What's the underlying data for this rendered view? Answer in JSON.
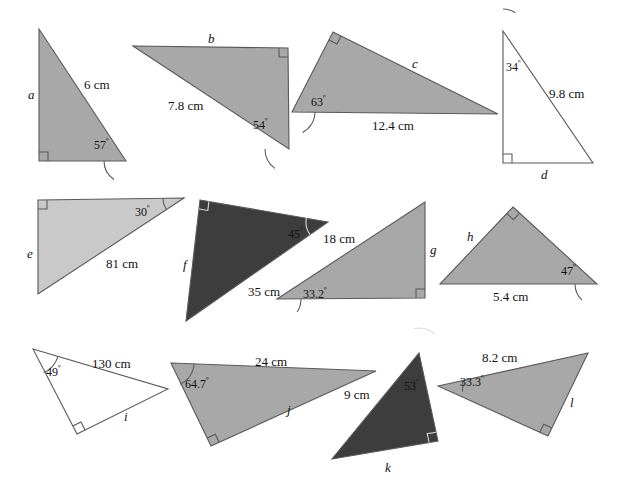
{
  "page": {
    "background_color": "#ffffff",
    "width": 618,
    "height": 491
  },
  "palette": {
    "fill_medium_gray": "#a8a8a8",
    "fill_light_gray": "#c9c9c9",
    "fill_dark_gray": "#3d3d3d",
    "fill_white": "#ffffff",
    "stroke": "#5a5a5a",
    "text": "#111111"
  },
  "figures": [
    {
      "id": "a",
      "name_label": "a",
      "fill": "#a8a8a8",
      "points": "39,29 39,161 126,161",
      "right_angle_at": "39,161",
      "right_angle_dirs": "x+,y-",
      "labels": [
        {
          "kind": "name",
          "text": "a",
          "x": 28,
          "y": 88
        },
        {
          "kind": "side",
          "text": "6 cm",
          "x": 84,
          "y": 78
        },
        {
          "kind": "angle",
          "text": "57",
          "x": 94,
          "y": 139
        }
      ],
      "arc": {
        "cx": 126,
        "cy": 161,
        "r": 22,
        "a0": 180,
        "a1": 237
      }
    },
    {
      "id": "b",
      "name_label": "b",
      "fill": "#a8a8a8",
      "points": "133,46 288,48 289,149",
      "right_angle_at": "288,48",
      "right_angle_dirs": "x-,y+",
      "labels": [
        {
          "kind": "name",
          "text": "b",
          "x": 208,
          "y": 32
        },
        {
          "kind": "side",
          "text": "7.8 cm",
          "x": 168,
          "y": 99
        },
        {
          "kind": "angle",
          "text": "54",
          "x": 253,
          "y": 119
        }
      ],
      "arc": {
        "cx": 289,
        "cy": 149,
        "r": 24,
        "a0": 180,
        "a1": 234
      }
    },
    {
      "id": "c",
      "name_label": "c",
      "fill": "#a8a8a8",
      "points": "333,32 498,114 292,112",
      "right_angle_at": "333,32",
      "right_angle_dirs": "se",
      "labels": [
        {
          "kind": "name",
          "text": "c",
          "x": 412,
          "y": 57
        },
        {
          "kind": "side",
          "text": "12.4 cm",
          "x": 372,
          "y": 119
        },
        {
          "kind": "angle",
          "text": "63",
          "x": 311,
          "y": 96
        }
      ],
      "arc": {
        "cx": 292,
        "cy": 112,
        "r": 23,
        "a0": 0,
        "a1": -63
      }
    },
    {
      "id": "d",
      "name_label": "d",
      "fill": "#ffffff",
      "points": "503,31 593,163 503,163",
      "right_angle_at": "503,163",
      "right_angle_dirs": "x+,y-",
      "labels": [
        {
          "kind": "name",
          "text": "d",
          "x": 541,
          "y": 168
        },
        {
          "kind": "side",
          "text": "9.8 cm",
          "x": 549,
          "y": 87
        },
        {
          "kind": "angle",
          "text": "34",
          "x": 506,
          "y": 61
        }
      ],
      "arc": {
        "cx": 503,
        "cy": 31,
        "r": 22,
        "a0": 90,
        "a1": 56
      }
    },
    {
      "id": "e",
      "name_label": "e",
      "fill": "#c9c9c9",
      "points": "38,200 184,198 38,294",
      "right_angle_at": "38,200",
      "right_angle_dirs": "x+,y+",
      "labels": [
        {
          "kind": "name",
          "text": "e",
          "x": 27,
          "y": 247
        },
        {
          "kind": "side",
          "text": "81 cm",
          "x": 106,
          "y": 257
        },
        {
          "kind": "angle",
          "text": "30",
          "x": 135,
          "y": 206
        }
      ],
      "arc": {
        "cx": 184,
        "cy": 198,
        "r": 21,
        "a0": 180,
        "a1": 213
      }
    },
    {
      "id": "f",
      "name_label": "f",
      "fill": "#3d3d3d",
      "points": "200,200 328,222 186,321",
      "right_angle_at": "200,200",
      "right_angle_dirs": "se",
      "labels": [
        {
          "kind": "name",
          "text": "f",
          "x": 183,
          "y": 258
        },
        {
          "kind": "side",
          "text": "35 cm",
          "x": 248,
          "y": 285
        },
        {
          "kind": "angle",
          "text": "45",
          "x": 288,
          "y": 228
        }
      ],
      "arc": {
        "cx": 328,
        "cy": 222,
        "r": 22,
        "a0": 170,
        "a1": 215
      }
    },
    {
      "id": "g",
      "name_label": "g",
      "fill": "#a8a8a8",
      "points": "425,202 425,298 277,299",
      "right_angle_at": "425,298",
      "right_angle_dirs": "x-,y-",
      "labels": [
        {
          "kind": "name",
          "text": "g",
          "x": 430,
          "y": 243
        },
        {
          "kind": "side",
          "text": "18 cm",
          "x": 323,
          "y": 232
        },
        {
          "kind": "angle",
          "text": "33.2",
          "x": 303,
          "y": 288
        }
      ],
      "arc": {
        "cx": 277,
        "cy": 299,
        "r": 24,
        "a0": 0,
        "a1": -33
      }
    },
    {
      "id": "h",
      "name_label": "h",
      "fill": "#a8a8a8",
      "points": "513,207 597,284 440,284",
      "right_angle_at": "513,207",
      "right_angle_dirs": "diamond",
      "labels": [
        {
          "kind": "name",
          "text": "h",
          "x": 467,
          "y": 230
        },
        {
          "kind": "side",
          "text": "5.4 cm",
          "x": 493,
          "y": 290
        },
        {
          "kind": "angle",
          "text": "47",
          "x": 561,
          "y": 265
        }
      ],
      "arc": {
        "cx": 597,
        "cy": 284,
        "r": 22,
        "a0": 180,
        "a1": 227
      }
    },
    {
      "id": "i",
      "name_label": "i",
      "fill": "#ffffff",
      "points": "33,349 168,389 77,434",
      "right_angle_at": "77,434",
      "right_angle_dirs": "ne",
      "labels": [
        {
          "kind": "name",
          "text": "i",
          "x": 124,
          "y": 410
        },
        {
          "kind": "side",
          "text": "130 cm",
          "x": 92,
          "y": 357
        },
        {
          "kind": "angle",
          "text": "49",
          "x": 46,
          "y": 366
        }
      ],
      "arc": {
        "cx": 33,
        "cy": 349,
        "r": 26,
        "a0": -17,
        "a1": -66
      }
    },
    {
      "id": "j",
      "name_label": "j",
      "fill": "#a8a8a8",
      "points": "171,363 376,371 211,446",
      "right_angle_at": "211,446",
      "right_angle_dirs": "ne",
      "labels": [
        {
          "kind": "name",
          "text": "j",
          "x": 287,
          "y": 403
        },
        {
          "kind": "side",
          "text": "24 cm",
          "x": 255,
          "y": 355
        },
        {
          "kind": "angle",
          "text": "64.7",
          "x": 185,
          "y": 378
        }
      ],
      "arc": {
        "cx": 171,
        "cy": 363,
        "r": 23,
        "a0": -2,
        "a1": -67
      }
    },
    {
      "id": "k",
      "name_label": "k",
      "fill": "#3d3d3d",
      "points": "419,353 438,441 332,459",
      "right_angle_at": "438,441",
      "right_angle_dirs": "nw",
      "labels": [
        {
          "kind": "name",
          "text": "k",
          "x": 385,
          "y": 461
        },
        {
          "kind": "side",
          "text": "9 cm",
          "x": 344,
          "y": 388
        },
        {
          "kind": "angle",
          "text": "53",
          "x": 404,
          "y": 380
        }
      ],
      "arc": {
        "cx": 419,
        "cy": 353,
        "r": 25,
        "a0": 102,
        "a1": 50
      }
    },
    {
      "id": "l",
      "name_label": "l",
      "fill": "#a8a8a8",
      "points": "438,386 588,353 548,436",
      "right_angle_at": "548,436",
      "right_angle_dirs": "nw",
      "labels": [
        {
          "kind": "name",
          "text": "l",
          "x": 570,
          "y": 396
        },
        {
          "kind": "side",
          "text": "8.2 cm",
          "x": 482,
          "y": 351
        },
        {
          "kind": "angle",
          "text": "33.3",
          "x": 460,
          "y": 376
        }
      ],
      "arc": {
        "cx": 438,
        "cy": 386,
        "r": 25,
        "a0": 12,
        "a1": -13
      }
    }
  ],
  "degree_symbol": "º"
}
